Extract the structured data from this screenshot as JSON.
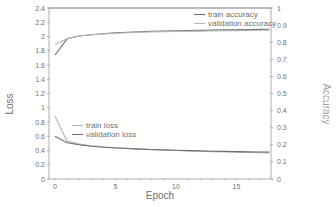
{
  "chart_data": {
    "type": "line",
    "title": "",
    "xlabel": "Epoch",
    "ylabel": "Loss",
    "y2label": "Accuracy",
    "xlim": [
      -0.5,
      19
    ],
    "ylim": [
      0,
      2.4
    ],
    "y2lim": [
      0,
      1
    ],
    "xticks": [
      0,
      5,
      10,
      15
    ],
    "yticks": [
      0,
      0.2,
      0.4,
      0.6,
      0.8,
      1,
      1.2,
      1.4,
      1.6,
      1.8,
      2,
      2.2,
      2.4
    ],
    "y2ticks": [
      0,
      0.1,
      0.2,
      0.3,
      0.4,
      0.5,
      0.6,
      0.7,
      0.8,
      0.9,
      1
    ],
    "grid": false,
    "x": [
      0,
      1,
      2,
      3,
      4,
      5,
      6,
      7,
      8,
      9,
      10,
      11,
      12,
      13,
      14,
      15,
      16,
      17,
      18,
      19
    ],
    "series": [
      {
        "name": "train accuracy",
        "axis": "right",
        "color": "#6e6e6e",
        "values": [
          0.725,
          0.82,
          0.836,
          0.844,
          0.85,
          0.855,
          0.858,
          0.861,
          0.863,
          0.865,
          0.867,
          0.868,
          0.869,
          0.871,
          0.872,
          0.873,
          0.874,
          0.875,
          0.876,
          0.877
        ]
      },
      {
        "name": "validation accuracy",
        "axis": "right",
        "color": "#b5b5b5",
        "values": [
          0.785,
          0.822,
          0.836,
          0.843,
          0.848,
          0.852,
          0.855,
          0.858,
          0.86,
          0.862,
          0.863,
          0.864,
          0.865,
          0.866,
          0.867,
          0.868,
          0.869,
          0.87,
          0.87,
          0.871
        ]
      },
      {
        "name": "train loss",
        "axis": "left",
        "color": "#b5b5b5",
        "values": [
          0.88,
          0.53,
          0.49,
          0.465,
          0.45,
          0.44,
          0.43,
          0.42,
          0.41,
          0.405,
          0.4,
          0.395,
          0.39,
          0.385,
          0.38,
          0.375,
          0.372,
          0.368,
          0.365,
          0.362
        ]
      },
      {
        "name": "validation loss",
        "axis": "left",
        "color": "#6e6e6e",
        "values": [
          0.6,
          0.51,
          0.48,
          0.46,
          0.445,
          0.435,
          0.428,
          0.42,
          0.414,
          0.408,
          0.403,
          0.398,
          0.394,
          0.39,
          0.387,
          0.384,
          0.381,
          0.379,
          0.377,
          0.375
        ]
      }
    ],
    "legends": [
      {
        "position": "upper-right",
        "entries": [
          "train accuracy",
          "validation accuracy"
        ]
      },
      {
        "position": "center-left",
        "entries": [
          "train loss",
          "validation loss"
        ]
      }
    ]
  }
}
